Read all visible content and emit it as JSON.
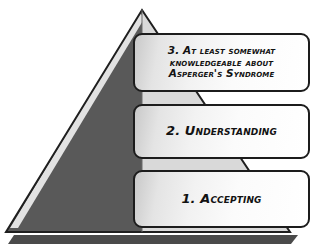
{
  "diagram": {
    "title": "Asperger's Syndrome support pyramid",
    "type": "pyramid",
    "background_color": "#ffffff",
    "shape": {
      "name": "pyramid",
      "left_face_color": "#595959",
      "right_face_color": "#d9d9d9",
      "edge_highlight_color": "#e8e8e8",
      "outline_color": "#1c1c1c",
      "shadow_color": "#4a4a4a",
      "apex": "142,10",
      "base_left": "6,232",
      "base_right": "290,232"
    },
    "levels": [
      {
        "number": "3",
        "label": "3. At least somewhat\nknowledgeable about\nAsperger's Syndrome",
        "position": "top"
      },
      {
        "number": "2",
        "label": "2. Understanding",
        "position": "middle"
      },
      {
        "number": "1",
        "label": "1. Accepting",
        "position": "bottom"
      }
    ]
  }
}
